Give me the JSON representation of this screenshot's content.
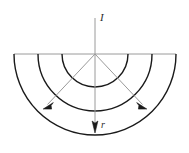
{
  "figure": {
    "title": "",
    "labels": {
      "current_symbol": "I",
      "radius_symbol": "r"
    },
    "colors": {
      "stroke_dark": "#1a1a1a",
      "stroke_light": "#8d8d8d",
      "background": "#ffffff"
    },
    "geometry": {
      "center_x": 95,
      "center_y": 54,
      "baseline_y": 54,
      "baseline_x_start": 14,
      "baseline_x_end": 176,
      "arc_radii": [
        33,
        57,
        81
      ],
      "vertical_line_top_y": 18,
      "vertical_arrow_tip_y": 132,
      "ray_left_angle_deg": 237,
      "ray_right_angle_deg": 303,
      "ray_length": 72
    },
    "elements": [
      {
        "name": "baseline",
        "kind": "line"
      },
      {
        "name": "arc-inner",
        "kind": "semicircle-arc"
      },
      {
        "name": "arc-middle",
        "kind": "semicircle-arc"
      },
      {
        "name": "arc-outer",
        "kind": "semicircle-arc"
      },
      {
        "name": "current-axis",
        "kind": "line-with-arrow"
      },
      {
        "name": "radius-ray-left",
        "kind": "line-with-arrow"
      },
      {
        "name": "radius-ray-right",
        "kind": "line-with-arrow"
      }
    ]
  }
}
